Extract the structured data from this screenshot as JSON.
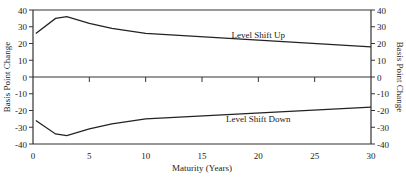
{
  "chart_data": {
    "type": "line",
    "title": "",
    "xlabel": "Maturity (Years)",
    "ylabel": "Basis Point Change",
    "ylabel_right": "Basis Point Change",
    "xlim": [
      0,
      30
    ],
    "ylim": [
      -40,
      40
    ],
    "xticks": [
      0,
      5,
      10,
      15,
      20,
      25,
      30
    ],
    "yticks": [
      -40,
      -30,
      -20,
      -10,
      0,
      10,
      20,
      30,
      40
    ],
    "grid": false,
    "legend": "none (inline annotations)",
    "series": [
      {
        "name": "Level Shift Up",
        "x": [
          0.25,
          2,
          3,
          5,
          7,
          10,
          30
        ],
        "y": [
          26,
          35,
          36,
          32,
          29,
          26,
          18
        ]
      },
      {
        "name": "Level Shift Down",
        "x": [
          0.25,
          2,
          3,
          5,
          7,
          10,
          30
        ],
        "y": [
          -26,
          -34,
          -35,
          -31,
          -28,
          -25,
          -18
        ]
      }
    ],
    "annotations": [
      {
        "text": "Level Shift Up",
        "x": 20,
        "y": 25
      },
      {
        "text": "Level Shift Down",
        "x": 20,
        "y": -25
      }
    ]
  }
}
